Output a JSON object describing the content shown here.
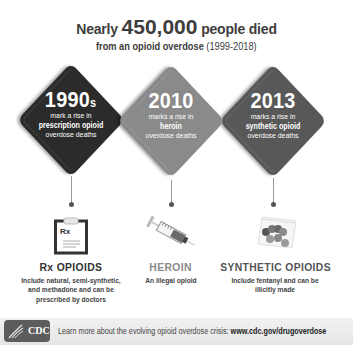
{
  "header": {
    "line1_prefix": "Nearly ",
    "line1_number": "450,000",
    "line1_suffix": " people died",
    "line2_bold": "from an opioid overdose",
    "line2_range": " (1999-2018)"
  },
  "milestones": [
    {
      "year": "1990",
      "year_suffix": "s",
      "line1": "mark a rise in",
      "line2_bold": "prescription opioid",
      "line3": "overdose deaths",
      "color": "#2b2b2b"
    },
    {
      "year": "2010",
      "year_suffix": "",
      "line1": "marks a rise in",
      "line2_bold": "heroin",
      "line3": "overdose deaths",
      "color": "#8a8a8a"
    },
    {
      "year": "2013",
      "year_suffix": "",
      "line1": "marks a rise in",
      "line2_bold": "synthetic opioid",
      "line3": "overdose deaths",
      "color": "#585858"
    }
  ],
  "categories": [
    {
      "icon": "clipboard-rx-icon",
      "icon_label": "Rx",
      "title": "Rx OPIOIDS",
      "title_color": "#333333",
      "desc_lines": [
        "Include natural, semi-synthetic,",
        "and methadone and can be",
        "prescribed by doctors"
      ]
    },
    {
      "icon": "syringe-icon",
      "title": "HEROIN",
      "title_color": "#8a8a8a",
      "desc_lines": [
        "An illegal opioid"
      ]
    },
    {
      "icon": "pill-bag-icon",
      "title": "SYNTHETIC OPIOIDS",
      "title_color": "#555555",
      "desc_lines": [
        "Include fentanyl and can be",
        "illicitly made"
      ]
    }
  ],
  "footer": {
    "logo_text": "CDC",
    "text": "Learn more about the evolving opioid overdose crisis: ",
    "link": "www.cdc.gov/drugoverdose"
  }
}
